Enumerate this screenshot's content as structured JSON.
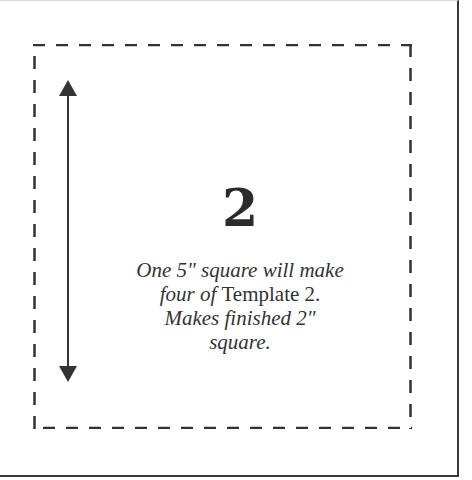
{
  "template": {
    "number": "2",
    "instructions": {
      "line1": "One 5\" square will make",
      "line2_italic": "four of ",
      "line2_upright": "Template 2.",
      "line3": "Makes finished 2\"",
      "line4": "square."
    }
  },
  "colors": {
    "ink": "#333333",
    "frame": "#3a3a3a",
    "background": "#ffffff"
  },
  "icons": {
    "measure_arrow": "double-headed-vertical-arrow"
  }
}
